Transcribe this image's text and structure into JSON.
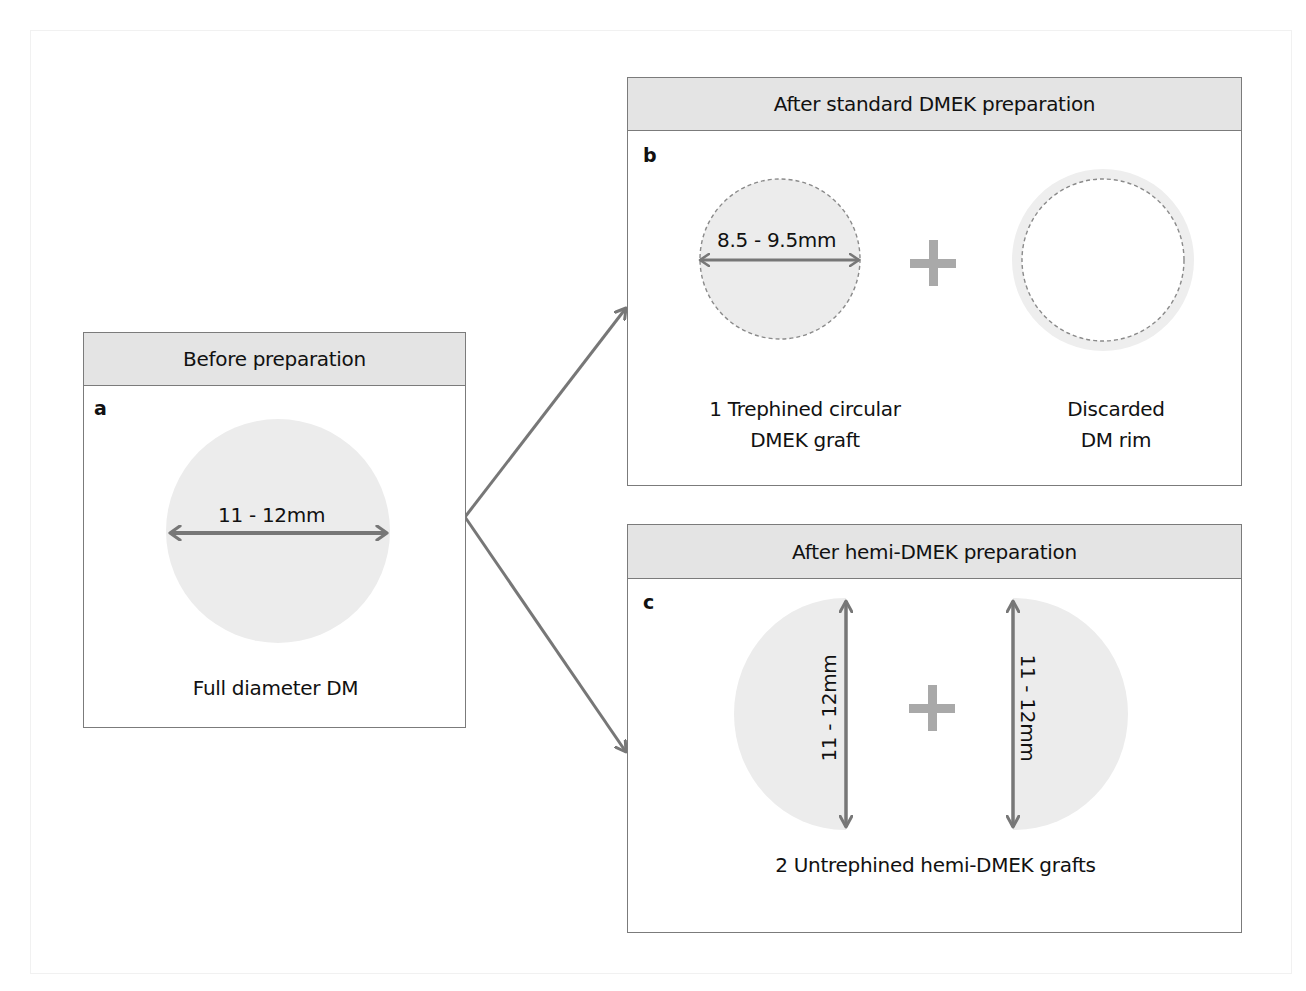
{
  "figure": {
    "panels": [
      {
        "id": "a",
        "letter": "a",
        "header": "Before preparation",
        "dimension": "11 - 12mm",
        "caption": "Full diameter DM"
      },
      {
        "id": "b",
        "letter": "b",
        "header": "After standard DMEK preparation",
        "dimension": "8.5 - 9.5mm",
        "caption_left_line1": "1 Trephined circular",
        "caption_left_line2": "DMEK graft",
        "caption_right_line1": "Discarded",
        "caption_right_line2": "DM rim"
      },
      {
        "id": "c",
        "letter": "c",
        "header": "After hemi-DMEK preparation",
        "dimension_left": "11 - 12mm",
        "dimension_right": "11 - 12mm",
        "caption": "2 Untrephined hemi-DMEK grafts"
      }
    ],
    "icons": {
      "plus": "plus-icon",
      "double_arrow": "double-arrow-icon",
      "connector_arrow": "arrow-icon"
    },
    "colors": {
      "border": "#7b7b7b",
      "header_fill": "#e4e4e4",
      "disc_fill": "#ececec",
      "arrow": "#777777",
      "plus": "#a9a9a9",
      "dashed_outline": "#8a8a8a"
    }
  }
}
